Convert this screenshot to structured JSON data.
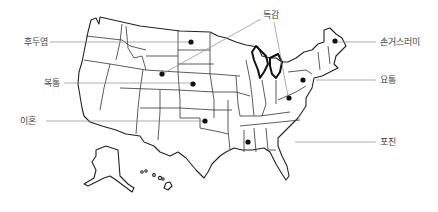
{
  "map": {
    "subject": "United States",
    "colors": {
      "outline": "#222222",
      "leader_line": "#8a8a8a",
      "marker": "#111111",
      "label_text": "#444444",
      "background": "#ffffff"
    }
  },
  "annotations": [
    {
      "id": "laryngitis",
      "label": "후두염",
      "label_x": 24,
      "label_y": 45,
      "anchor": "start",
      "line": [
        [
          50,
          42
        ],
        [
          189,
          42
        ]
      ],
      "dot": [
        191,
        42
      ],
      "state": "North Dakota"
    },
    {
      "id": "stomach-ache",
      "label": "복통",
      "label_x": 44,
      "label_y": 86,
      "anchor": "start",
      "line": [
        [
          64,
          83
        ],
        [
          191,
          83
        ]
      ],
      "dot": [
        193,
        84
      ],
      "state": "Nebraska"
    },
    {
      "id": "divorce",
      "label": "이혼",
      "label_x": 20,
      "label_y": 124,
      "anchor": "start",
      "line": [
        [
          46,
          121
        ],
        [
          203,
          121
        ]
      ],
      "dot": [
        205,
        121
      ],
      "state": "Oklahoma"
    },
    {
      "id": "flu",
      "label": "독감",
      "label_x": 263,
      "label_y": 18,
      "anchor": "start",
      "line": [
        [
          261,
          19
        ],
        [
          164,
          73
        ]
      ],
      "dot": [
        162,
        74
      ],
      "state": "Wyoming",
      "line2": [
        [
          274,
          22
        ],
        [
          288,
          96
        ]
      ],
      "dot2": [
        289,
        98
      ],
      "state2": "West Virginia"
    },
    {
      "id": "hangnail",
      "label": "손거스러미",
      "label_x": 380,
      "label_y": 45,
      "anchor": "start",
      "line": [
        [
          338,
          42
        ],
        [
          376,
          42
        ]
      ],
      "dot": [
        335,
        41
      ],
      "state": "Maine"
    },
    {
      "id": "back-pain",
      "label": "요통",
      "label_x": 380,
      "label_y": 83,
      "anchor": "start",
      "line": [
        [
          316,
          80
        ],
        [
          376,
          80
        ]
      ],
      "dot": [
        303,
        80
      ],
      "state": "Pennsylvania"
    },
    {
      "id": "herpes",
      "label": "포진",
      "label_x": 380,
      "label_y": 145,
      "anchor": "start",
      "line": [
        [
          295,
          142
        ],
        [
          376,
          142
        ]
      ],
      "dot": [
        248,
        142
      ],
      "state": "Mississippi"
    }
  ]
}
